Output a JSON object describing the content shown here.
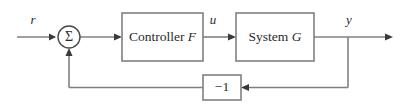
{
  "diagram": {
    "type": "block-diagram",
    "background_color": "#ffffff",
    "line_color": "#808080",
    "text_color": "#2b2b2b",
    "blocks": [
      {
        "id": "summing-junction",
        "shape": "circle",
        "label": "Σ",
        "cx": 69,
        "cy": 37,
        "r": 11
      },
      {
        "id": "controller-block",
        "shape": "rect",
        "label_text": "Controller",
        "label_var": "F",
        "x": 122,
        "y": 13,
        "width": 81,
        "height": 48
      },
      {
        "id": "system-block",
        "shape": "rect",
        "label_text": "System",
        "label_var": "G",
        "x": 236,
        "y": 13,
        "width": 78,
        "height": 48
      },
      {
        "id": "feedback-gain-block",
        "shape": "rect",
        "label": "−1",
        "x": 203,
        "y": 75,
        "width": 38,
        "height": 25
      }
    ],
    "signals": [
      {
        "id": "reference-signal",
        "label": "r",
        "x": 33,
        "y": 24
      },
      {
        "id": "control-signal",
        "label": "u",
        "x": 213,
        "y": 24
      },
      {
        "id": "output-signal",
        "label": "y",
        "x": 349,
        "y": 24
      }
    ],
    "connections": [
      {
        "from": "reference-input",
        "to": "summing-junction"
      },
      {
        "from": "summing-junction",
        "to": "controller-block"
      },
      {
        "from": "controller-block",
        "to": "system-block"
      },
      {
        "from": "system-block",
        "to": "output-terminal"
      },
      {
        "from": "output-tap",
        "to": "feedback-gain-block"
      },
      {
        "from": "feedback-gain-block",
        "to": "summing-junction"
      }
    ]
  }
}
